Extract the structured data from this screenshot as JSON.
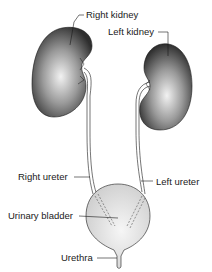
{
  "diagram": {
    "type": "anatomical-illustration",
    "labels": {
      "right_kidney": "Right kidney",
      "left_kidney": "Left kidney",
      "right_ureter": "Right ureter",
      "left_ureter": "Left ureter",
      "urinary_bladder": "Urinary bladder",
      "urethra": "Urethra"
    },
    "colors": {
      "kidney_dark": "#2e2e2e",
      "kidney_light": "#f2f2f2",
      "bladder_fill": "#dcdcdc",
      "bladder_light": "#f4f4f4",
      "outline": "#1a1a1a",
      "text": "#1a1a1a"
    }
  }
}
